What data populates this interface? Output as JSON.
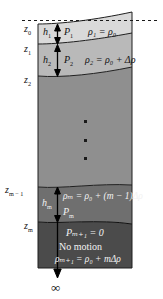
{
  "figure": {
    "background_color": "#ffffff",
    "width": 163,
    "height": 299
  },
  "surface": {
    "mean_level_line": "dashed",
    "mean_level_color": "#1a1a1a"
  },
  "depth_labels": [
    {
      "id": "z0",
      "text": "z",
      "sub": "0"
    },
    {
      "id": "z1",
      "text": "z",
      "sub": "1"
    },
    {
      "id": "z2",
      "text": "z",
      "sub": "2"
    },
    {
      "id": "zm1",
      "text": "z",
      "sub": "m − 1"
    },
    {
      "id": "zm",
      "text": "z",
      "sub": "m"
    }
  ],
  "layers": [
    {
      "index": 1,
      "thickness_label": "h",
      "thickness_sub": "1",
      "pressure_label": "P",
      "pressure_sub": "1",
      "density_equation": "ρ₁ = ρ₀",
      "fill_color": "#d9d9d9"
    },
    {
      "index": 2,
      "thickness_label": "h",
      "thickness_sub": "2",
      "pressure_label": "P",
      "pressure_sub": "2",
      "density_equation": "ρ₂ = ρ₀ + Δρ",
      "fill_color": "#b8b8b8"
    },
    {
      "index": 3,
      "thickness_label": "",
      "thickness_sub": "",
      "pressure_label": "",
      "pressure_sub": "",
      "density_equation": "",
      "fill_color": "#8f8f8f"
    },
    {
      "index": 4,
      "thickness_label": "h",
      "thickness_sub": "m",
      "pressure_label": "P",
      "pressure_sub": "m",
      "density_equation": "ρₘ = ρ₀ + (m − 1)Δρ",
      "fill_color": "#6e6e6e"
    },
    {
      "index": 5,
      "thickness_label": "",
      "thickness_sub": "",
      "pressure_label": "",
      "pressure_sub": "",
      "density_equation": "ρₘ₊₁ = ρ₀ + mΔρ",
      "fill_color": "#4a4a4a"
    }
  ],
  "bottom_layer": {
    "pressure_equation": "Pₘ₊₁ = 0",
    "motion_text": "No motion",
    "density_equation": "ρₘ₊₁ = ρ₀ + mΔρ"
  },
  "ellipsis": {
    "symbol": "vertical-dots",
    "count": 3
  },
  "infinity": {
    "symbol": "∞"
  },
  "arrows": {
    "h1": "double-headed-vertical-arrow",
    "h2": "double-headed-vertical-arrow",
    "hm": "double-headed-vertical-arrow",
    "depth": "down-arrow-to-infinity"
  }
}
